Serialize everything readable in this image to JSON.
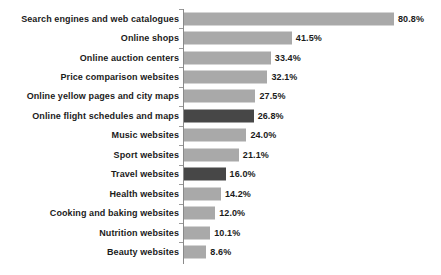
{
  "chart_data": {
    "type": "bar",
    "orientation": "horizontal",
    "title": "",
    "subtitle": "",
    "xlabel": "",
    "ylabel": "",
    "grid": false,
    "legend": false,
    "xlim": [
      0,
      80.8
    ],
    "value_suffix": "%",
    "categories": [
      "Search engines and web catalogues",
      "Online shops",
      "Online auction centers",
      "Price comparison websites",
      "Online yellow pages and city maps",
      "Online flight schedules and maps",
      "Music websites",
      "Sport websites",
      "Travel websites",
      "Health websites",
      "Cooking and baking websites",
      "Nutrition websites",
      "Beauty websites"
    ],
    "values": [
      80.8,
      41.5,
      33.4,
      32.1,
      27.5,
      26.8,
      24.0,
      21.1,
      16.0,
      14.2,
      12.0,
      10.1,
      8.6
    ],
    "value_labels": [
      "80.8%",
      "41.5%",
      "33.4%",
      "32.1%",
      "27.5%",
      "26.8%",
      "24.0%",
      "21.1%",
      "16.0%",
      "14.2%",
      "12.0%",
      "10.1%",
      "8.6%"
    ],
    "highlighted": [
      false,
      false,
      false,
      false,
      false,
      true,
      false,
      false,
      true,
      false,
      false,
      false,
      false
    ],
    "colors": {
      "bar": "#a9a9a9",
      "bar_highlight": "#474747",
      "axis": "#8a8a8a",
      "text": "#1b1b1b",
      "background": "#ffffff"
    }
  }
}
